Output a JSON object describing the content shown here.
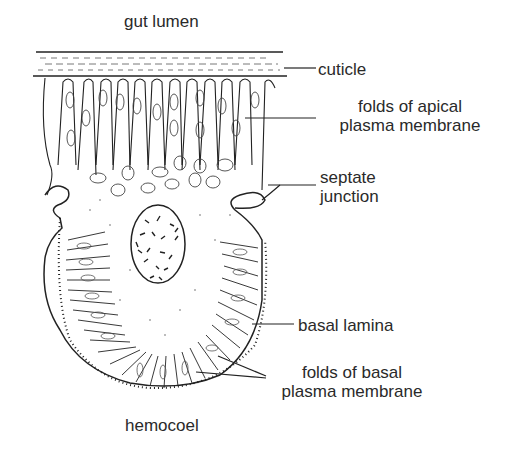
{
  "diagram": {
    "top_label": "gut lumen",
    "bottom_label": "hemocoel",
    "labels": {
      "cuticle": "cuticle",
      "apical_line1": "folds of apical",
      "apical_line2": "plasma membrane",
      "septate_line1": "septate",
      "septate_line2": "junction",
      "basal_lamina": "basal lamina",
      "basal_line1": "folds of basal",
      "basal_line2": "plasma membrane"
    }
  }
}
